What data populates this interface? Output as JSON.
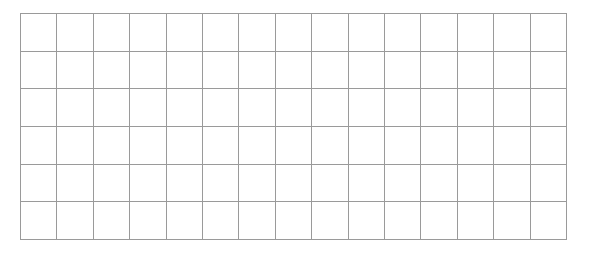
{
  "grid": {
    "rows": 6,
    "columns": 15,
    "line_color": "#9a9a9a",
    "background": "#ffffff",
    "cells_empty": true
  }
}
